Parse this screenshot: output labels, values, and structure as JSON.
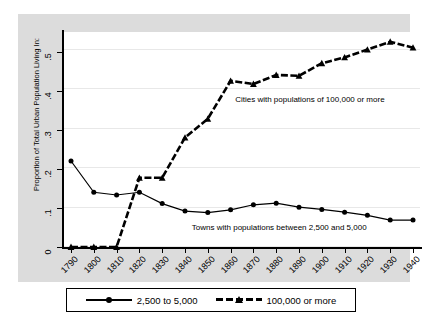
{
  "chart_data": {
    "type": "line",
    "title": "",
    "xlabel": "year",
    "ylabel": "Proportion of Total Urban Population Living In:",
    "categories": [
      1790,
      1800,
      1810,
      1820,
      1830,
      1840,
      1850,
      1860,
      1870,
      1880,
      1890,
      1900,
      1910,
      1920,
      1930,
      1940
    ],
    "x": [
      1790,
      1800,
      1810,
      1820,
      1830,
      1840,
      1850,
      1860,
      1870,
      1880,
      1890,
      1900,
      1910,
      1920,
      1930,
      1940
    ],
    "xlim": [
      1790,
      1940
    ],
    "ylim": [
      0,
      0.55
    ],
    "yticks": [
      0,
      0.1,
      0.2,
      0.3,
      0.4,
      0.5
    ],
    "ytick_labels": [
      "0",
      ".1",
      ".2",
      ".3",
      ".4",
      ".5"
    ],
    "xtick_labels": [
      "1790",
      "1800",
      "1810",
      "1820",
      "1830",
      "1840",
      "1850",
      "1860",
      "1870",
      "1880",
      "1890",
      "1900",
      "1910",
      "1920",
      "1930",
      "1940"
    ],
    "grid": "horizontal",
    "legend_position": "bottom",
    "series": [
      {
        "name": "2,500 to 5,000",
        "marker": "circle",
        "linestyle": "solid",
        "color": "#000000",
        "values": [
          0.22,
          0.14,
          0.133,
          0.14,
          0.111,
          0.092,
          0.088,
          0.095,
          0.108,
          0.112,
          0.102,
          0.096,
          0.089,
          0.081,
          0.069,
          0.069
        ]
      },
      {
        "name": "100,000 or more",
        "marker": "triangle",
        "linestyle": "dashed",
        "color": "#000000",
        "values": [
          0.0,
          0.0,
          0.0,
          0.177,
          0.177,
          0.28,
          0.328,
          0.425,
          0.417,
          0.44,
          0.438,
          0.47,
          0.485,
          0.505,
          0.525,
          0.51
        ]
      }
    ],
    "annotations": [
      {
        "text": "Cities with populations of 100,000 or more",
        "x": 1862,
        "y": 0.375
      },
      {
        "text": "Towns with populations between 2,500 and 5,000",
        "x": 1843,
        "y": 0.048
      }
    ]
  },
  "legend": {
    "entries": [
      {
        "label": "2,500 to 5,000",
        "marker": "circle-marker-icon",
        "line": "solid-line-icon"
      },
      {
        "label": "100,000 or more",
        "marker": "triangle-marker-icon",
        "line": "dashed-line-icon"
      }
    ]
  },
  "colors": {
    "series": "#000000",
    "plot_background": "#ffffff",
    "canvas_background": "#dcdcdc",
    "gridline": "#e8e8e8",
    "axis": "#000000"
  }
}
